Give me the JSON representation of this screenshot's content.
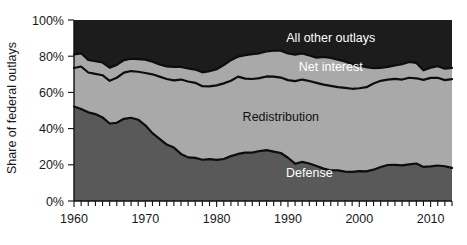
{
  "chart_data": {
    "type": "area",
    "title": "",
    "subtitle": "",
    "xlabel": "",
    "ylabel": "Share of federal outlays",
    "stacked": true,
    "stack_order_bottom_to_top": [
      "Defense",
      "Redistribution",
      "Net interest",
      "All other outlays"
    ],
    "grid": false,
    "legend_position": "inline-labels",
    "xlim": [
      1960,
      2013
    ],
    "ylim": [
      0,
      100
    ],
    "x_tick_labels": [
      "1960",
      "1970",
      "1980",
      "1990",
      "2000",
      "2010"
    ],
    "x_tick_values": [
      1960,
      1970,
      1980,
      1990,
      2000,
      2010
    ],
    "x_minor_tick_interval": 1,
    "y_tick_labels": [
      "0%",
      "20%",
      "40%",
      "60%",
      "80%",
      "100%"
    ],
    "y_tick_values": [
      0,
      20,
      40,
      60,
      80,
      100
    ],
    "colors": {
      "Defense": "#595959",
      "Redistribution": "#a9a9a9",
      "Net interest": "#a9a9a9",
      "All other outlays": "#1c1c1c",
      "separator": "#0d0d0d",
      "axis": "#111111",
      "background": "#ffffff"
    },
    "annotations": [
      {
        "text": "All other outlays",
        "x": 1996,
        "y": 88,
        "color": "#ffffff"
      },
      {
        "text": "Net interest",
        "x": 1996,
        "y": 72,
        "color": "#ffffff"
      },
      {
        "text": "Redistribution",
        "x": 1989,
        "y": 44,
        "color": "#111111"
      },
      {
        "text": "Defense",
        "x": 1993,
        "y": 13,
        "color": "#ffffff"
      }
    ],
    "x": [
      1960,
      1961,
      1962,
      1963,
      1964,
      1965,
      1966,
      1967,
      1968,
      1969,
      1970,
      1971,
      1972,
      1973,
      1974,
      1975,
      1976,
      1977,
      1978,
      1979,
      1980,
      1981,
      1982,
      1983,
      1984,
      1985,
      1986,
      1987,
      1988,
      1989,
      1990,
      1991,
      1992,
      1993,
      1994,
      1995,
      1996,
      1997,
      1998,
      1999,
      2000,
      2001,
      2002,
      2003,
      2004,
      2005,
      2006,
      2007,
      2008,
      2009,
      2010,
      2011,
      2012,
      2013
    ],
    "series": [
      {
        "name": "Defense",
        "color": "#595959",
        "values": [
          52.2,
          50.8,
          49.0,
          48.0,
          46.2,
          42.8,
          43.2,
          45.4,
          46.0,
          44.9,
          41.8,
          37.5,
          34.3,
          31.2,
          29.5,
          26.0,
          24.1,
          23.8,
          22.8,
          23.1,
          22.7,
          23.2,
          24.8,
          26.0,
          26.7,
          26.7,
          27.6,
          28.1,
          27.3,
          26.5,
          23.9,
          20.6,
          21.6,
          20.7,
          19.3,
          17.9,
          17.0,
          16.9,
          16.2,
          16.1,
          16.5,
          16.4,
          17.3,
          18.8,
          19.9,
          20.0,
          19.7,
          20.2,
          20.7,
          18.8,
          19.1,
          19.6,
          19.2,
          18.3
        ]
      },
      {
        "name": "Redistribution",
        "color": "#a9a9a9",
        "values": [
          21.3,
          23.5,
          22.0,
          22.2,
          23.3,
          23.6,
          24.9,
          25.5,
          25.8,
          26.5,
          28.9,
          32.5,
          34.4,
          36.2,
          37.1,
          41.1,
          41.9,
          41.5,
          40.6,
          40.2,
          41.2,
          41.8,
          41.6,
          42.7,
          40.9,
          40.7,
          40.3,
          40.7,
          41.4,
          41.7,
          42.9,
          45.6,
          45.5,
          45.6,
          46.0,
          46.4,
          46.6,
          46.0,
          46.3,
          45.9,
          45.8,
          46.5,
          47.6,
          47.6,
          47.2,
          47.5,
          47.4,
          47.9,
          47.1,
          48.1,
          48.9,
          48.5,
          47.6,
          49.0
        ]
      },
      {
        "name": "Net interest",
        "color": "#a9a9a9",
        "values": [
          7.5,
          7.3,
          6.9,
          7.0,
          7.0,
          7.3,
          7.1,
          6.9,
          6.8,
          7.0,
          7.4,
          7.0,
          6.8,
          7.0,
          7.5,
          7.0,
          7.2,
          7.3,
          7.7,
          8.4,
          8.9,
          10.1,
          11.4,
          11.1,
          13.0,
          13.7,
          13.7,
          13.8,
          14.3,
          14.8,
          14.7,
          14.7,
          14.4,
          14.1,
          13.9,
          15.3,
          15.5,
          15.2,
          14.6,
          13.5,
          12.5,
          11.1,
          8.5,
          7.1,
          7.0,
          7.4,
          8.5,
          8.7,
          8.5,
          5.3,
          5.7,
          6.4,
          6.3,
          6.2
        ]
      },
      {
        "name": "All other outlays",
        "color": "#1c1c1c",
        "values": [
          19.0,
          18.4,
          22.1,
          22.8,
          23.5,
          26.3,
          24.8,
          22.2,
          21.4,
          21.6,
          21.9,
          23.0,
          24.5,
          25.6,
          25.9,
          25.9,
          26.8,
          27.4,
          28.9,
          28.3,
          27.2,
          24.9,
          22.2,
          20.2,
          19.4,
          18.9,
          18.4,
          17.4,
          17.0,
          17.0,
          18.5,
          19.1,
          18.5,
          19.6,
          20.8,
          20.4,
          20.9,
          21.9,
          22.9,
          24.5,
          25.2,
          26.0,
          26.6,
          26.5,
          25.9,
          25.1,
          24.4,
          23.2,
          23.7,
          27.8,
          26.3,
          25.5,
          26.9,
          26.5
        ]
      }
    ]
  },
  "axes": {
    "y_title": "Share of federal outlays",
    "y_ticks": [
      "100%",
      "80%",
      "60%",
      "40%",
      "20%",
      "0%"
    ],
    "x_ticks": [
      "1960",
      "1970",
      "1980",
      "1990",
      "2000",
      "2010"
    ]
  },
  "labels": {
    "all_other_outlays": "All other outlays",
    "net_interest": "Net interest",
    "redistribution": "Redistribution",
    "defense": "Defense"
  }
}
